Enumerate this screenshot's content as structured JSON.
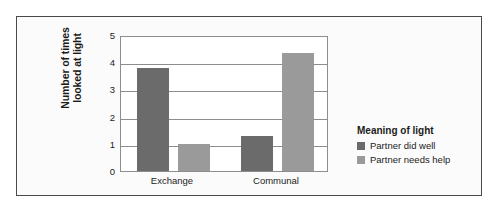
{
  "chart_data": {
    "type": "bar",
    "title": "",
    "xlabel": "",
    "ylabel_line1": "Number of times",
    "ylabel_line2": "looked at light",
    "categories": [
      "Exchange",
      "Communal"
    ],
    "series": [
      {
        "name": "Partner did well",
        "color": "#6b6b6b",
        "values": [
          3.8,
          1.3
        ]
      },
      {
        "name": "Partner needs help",
        "color": "#9a9a9a",
        "values": [
          1.0,
          4.35
        ]
      }
    ],
    "ylim": [
      0,
      5
    ],
    "yticks": [
      0,
      1,
      2,
      3,
      4,
      5
    ],
    "ytick_labels": [
      "0",
      "1",
      "2",
      "3",
      "4",
      "5"
    ],
    "grid": true,
    "legend_position": "right",
    "legend_title": "Meaning of light"
  }
}
